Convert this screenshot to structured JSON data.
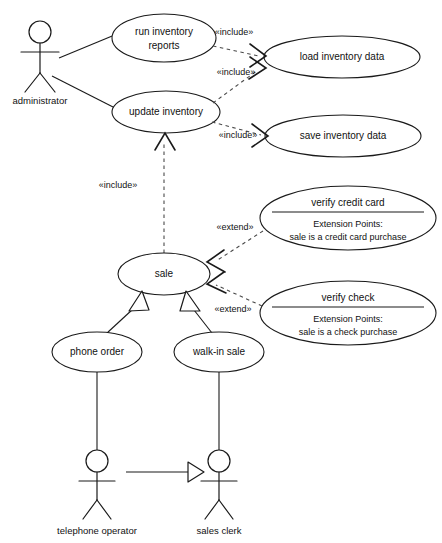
{
  "diagram": {
    "type": "uml-use-case-diagram",
    "title": "",
    "background_color": "#ffffff",
    "line_color": "#1a1a1a",
    "dashed_line_color": "#4a4a4a"
  },
  "actors": [
    {
      "id": "administrator",
      "label": "administrator",
      "cx": 40,
      "cy": 52,
      "label_y": 93
    },
    {
      "id": "telephone-operator",
      "label": "telephone operator",
      "cx": 97,
      "cy": 470,
      "label_y": 527
    },
    {
      "id": "sales-clerk",
      "label": "sales clerk",
      "cx": 219,
      "cy": 470,
      "label_y": 527
    }
  ],
  "use_cases": [
    {
      "id": "run-inventory-reports",
      "lines": [
        "run inventory",
        "reports"
      ],
      "cx": 164,
      "cy": 38,
      "rx": 52,
      "ry": 24,
      "compartment": false
    },
    {
      "id": "load-inventory-data",
      "lines": [
        "load inventory data"
      ],
      "cx": 342,
      "cy": 57,
      "rx": 78,
      "ry": 21,
      "compartment": false
    },
    {
      "id": "update-inventory",
      "lines": [
        "update inventory"
      ],
      "cx": 166,
      "cy": 112,
      "rx": 54,
      "ry": 21,
      "compartment": false
    },
    {
      "id": "save-inventory-data",
      "lines": [
        "save inventory data"
      ],
      "cx": 343,
      "cy": 136,
      "rx": 78,
      "ry": 21,
      "compartment": false
    },
    {
      "id": "verify-credit-card",
      "lines": [
        "verify credit card"
      ],
      "cx": 348,
      "cy": 218,
      "rx": 88,
      "ry": 32,
      "compartment": true,
      "compartment_title": "Extension Points:",
      "compartment_body": "sale is a credit card purchase"
    },
    {
      "id": "verify-check",
      "lines": [
        "verify check"
      ],
      "cx": 348,
      "cy": 313,
      "rx": 88,
      "ry": 32,
      "compartment": true,
      "compartment_title": "Extension Points:",
      "compartment_body": "sale is a check purchase"
    },
    {
      "id": "sale",
      "lines": [
        "sale"
      ],
      "cx": 164,
      "cy": 274,
      "rx": 46,
      "ry": 21,
      "compartment": false
    },
    {
      "id": "phone-order",
      "lines": [
        "phone order"
      ],
      "cx": 97,
      "cy": 352,
      "rx": 45,
      "ry": 20,
      "compartment": false
    },
    {
      "id": "walk-in-sale",
      "lines": [
        "walk-in sale"
      ],
      "cx": 219,
      "cy": 352,
      "rx": 45,
      "ry": 20,
      "compartment": false
    }
  ],
  "stereotype_labels": [
    {
      "id": "include-run-reports",
      "text": "«include»",
      "x": 234,
      "y": 33
    },
    {
      "id": "include-update-inventory",
      "text": "«include»",
      "x": 236,
      "y": 73
    },
    {
      "id": "include-save-inventory",
      "text": "«include»",
      "x": 238,
      "y": 136
    },
    {
      "id": "include-sale-update",
      "text": "«include»",
      "x": 118,
      "y": 186
    },
    {
      "id": "extend-credit-card",
      "text": "«extend»",
      "x": 235,
      "y": 228
    },
    {
      "id": "extend-check",
      "text": "«extend»",
      "x": 233,
      "y": 310
    }
  ],
  "relationships": [
    {
      "id": "admin-to-run-reports",
      "kind": "association"
    },
    {
      "id": "admin-to-update-inventory",
      "kind": "association"
    },
    {
      "id": "run-reports-to-load-data",
      "kind": "include"
    },
    {
      "id": "update-inventory-to-load-data",
      "kind": "include"
    },
    {
      "id": "update-inventory-to-save-data",
      "kind": "include"
    },
    {
      "id": "sale-to-update-inventory",
      "kind": "include"
    },
    {
      "id": "verify-credit-card-to-sale",
      "kind": "extend"
    },
    {
      "id": "verify-check-to-sale",
      "kind": "extend"
    },
    {
      "id": "phone-order-to-sale",
      "kind": "generalization"
    },
    {
      "id": "walk-in-sale-to-sale",
      "kind": "generalization"
    },
    {
      "id": "phone-order-to-operator",
      "kind": "association"
    },
    {
      "id": "walk-in-sale-to-clerk",
      "kind": "association"
    },
    {
      "id": "telephone-operator-to-sales-clerk",
      "kind": "generalization"
    }
  ]
}
